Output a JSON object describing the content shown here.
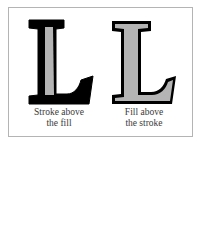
{
  "figure": {
    "panels": [
      {
        "letter": "L",
        "caption_line1": "Stroke above",
        "caption_line2": "the fill",
        "stroke_color": "#000000",
        "fill_color": "#b4b4b4"
      },
      {
        "letter": "L",
        "caption_line1": "Fill above",
        "caption_line2": "the stroke",
        "stroke_color": "#000000",
        "fill_color": "#b4b4b4"
      }
    ],
    "frame_border_color": "#b4b4b4"
  }
}
